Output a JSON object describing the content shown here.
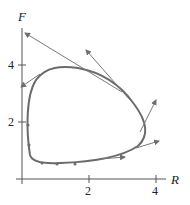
{
  "diagram": {
    "type": "phase-plane trajectory with tangent vectors",
    "axes": {
      "x_label": "R",
      "y_label": "F",
      "x_ticks": [
        {
          "value": 2,
          "label": "2"
        },
        {
          "value": 4,
          "label": "4"
        }
      ],
      "y_ticks": [
        {
          "value": 2,
          "label": "2"
        },
        {
          "value": 4,
          "label": "4"
        }
      ]
    },
    "curve": {
      "description": "closed counterclockwise-oriented loop (periodic orbit)",
      "color": "#6b6b6b"
    },
    "vectors": {
      "count": 6,
      "color": "#7a7a7a",
      "description": "tangent arrows drawn from points on the curve"
    },
    "dots": {
      "count": 5,
      "description": "sample points along the lower-left part of the curve"
    }
  }
}
